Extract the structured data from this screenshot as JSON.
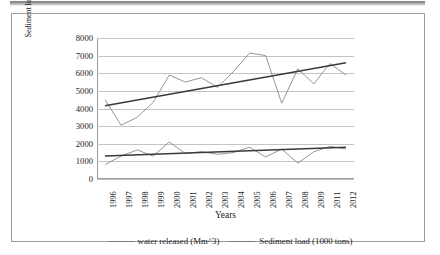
{
  "figure": {
    "border_color": "#9b9b9b",
    "background": "#ffffff"
  },
  "axis": {
    "y_title_line1": "Sediment load ( 1000 tons)",
    "y_title_line2": "Water released (Mm³)",
    "x_title": "Years",
    "y_ticks": [
      "8000",
      "7000",
      "6000",
      "5000",
      "4000",
      "3000",
      "2000",
      "1000",
      "0"
    ],
    "x_ticks": [
      "1996",
      "1997",
      "1998",
      "1999",
      "2000",
      "2001",
      "2002",
      "2003",
      "2004",
      "2005",
      "2006",
      "2007",
      "2008",
      "2009",
      "2011",
      "2012"
    ]
  },
  "legend": {
    "items": [
      {
        "label": "water released (Mm^3)",
        "color": "#7b7b7b"
      },
      {
        "label": "Sediment load (1000 tons)",
        "color": "#7b7b7b"
      }
    ]
  },
  "chart_data": {
    "type": "line",
    "title": "",
    "xlabel": "Years",
    "ylabel": "Sediment load ( 1000 tons) / Water released (Mm^3)",
    "ylim": [
      0,
      8000
    ],
    "ytick_step": 1000,
    "grid": true,
    "legend_position": "bottom",
    "categories": [
      "1996",
      "1997",
      "1998",
      "1999",
      "2000",
      "2001",
      "2002",
      "2003",
      "2004",
      "2005",
      "2006",
      "2007",
      "2008",
      "2009",
      "2011",
      "2012"
    ],
    "series": [
      {
        "name": "Sediment load (1000 tons)",
        "color": "#8a8a8a",
        "values": [
          4500,
          3050,
          3500,
          4350,
          5900,
          5500,
          5750,
          5200,
          6100,
          7150,
          7000,
          4300,
          6250,
          5400,
          6550,
          5900
        ],
        "trendline": {
          "type": "linear",
          "color": "#3a3a3a",
          "start": 4150,
          "end": 6600
        }
      },
      {
        "name": "water released (Mm^3)",
        "color": "#8a8a8a",
        "values": [
          820,
          1300,
          1650,
          1300,
          2100,
          1450,
          1550,
          1400,
          1500,
          1800,
          1250,
          1700,
          900,
          1550,
          1850,
          1700
        ],
        "trendline": {
          "type": "linear",
          "color": "#3a3a3a",
          "start": 1300,
          "end": 1800
        }
      }
    ],
    "annotations": []
  }
}
